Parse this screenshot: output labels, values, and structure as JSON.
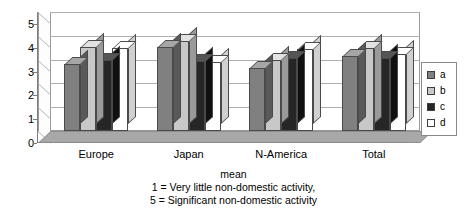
{
  "chart_data": {
    "type": "bar",
    "title": "",
    "xlabel": "",
    "ylabel": "",
    "ylim": [
      0,
      5
    ],
    "yticks": [
      "0",
      "1",
      "2",
      "3",
      "4",
      "5"
    ],
    "grid": true,
    "legend_position": "right",
    "style": "3d-clustered-column",
    "categories": [
      "Europe",
      "Japan",
      "N-America",
      "Total"
    ],
    "series": [
      {
        "name": "a",
        "values": [
          2.8,
          3.55,
          2.65,
          3.15
        ]
      },
      {
        "name": "b",
        "values": [
          3.55,
          3.8,
          3.0,
          3.5
        ]
      },
      {
        "name": "c",
        "values": [
          3.0,
          2.95,
          3.05,
          3.05
        ]
      },
      {
        "name": "d",
        "values": [
          3.5,
          2.9,
          3.45,
          3.25
        ]
      }
    ],
    "annotations": [
      "mean",
      "1 = Very little non-domestic activity,",
      "5 = Significant non-domestic activity"
    ]
  },
  "legend": {
    "items": [
      {
        "label": "a",
        "color": "#808080"
      },
      {
        "label": "b",
        "color": "#c8c8c8"
      },
      {
        "label": "c",
        "color": "#262626"
      },
      {
        "label": "d",
        "color": "#ffffff"
      }
    ]
  },
  "caption": {
    "line1": "mean",
    "line2": "1 = Very little non-domestic activity,",
    "line3": "5 = Significant non-domestic activity"
  },
  "colors": {
    "plot_background": "#ffffff",
    "floor": "#a8a8a8",
    "gridline": "#b0b0b0",
    "axis": "#7d7d7d",
    "text": "#000000"
  }
}
